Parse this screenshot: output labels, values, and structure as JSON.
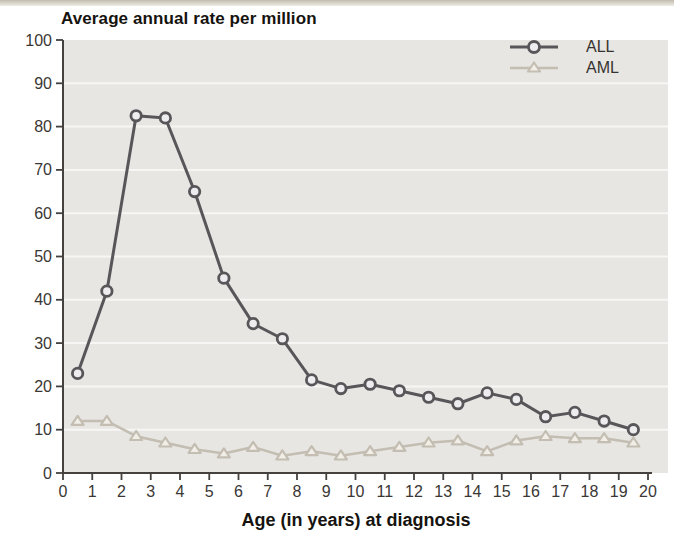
{
  "chart_data": {
    "type": "line",
    "title": "Average annual rate per million",
    "xlabel": "Age (in years) at diagnosis",
    "ylabel": "",
    "xlim": [
      0,
      20
    ],
    "ylim": [
      0,
      100
    ],
    "x_ticks": [
      0,
      1,
      2,
      3,
      4,
      5,
      6,
      7,
      8,
      9,
      10,
      11,
      12,
      13,
      14,
      15,
      16,
      17,
      18,
      19,
      20
    ],
    "y_ticks": [
      0,
      10,
      20,
      30,
      40,
      50,
      60,
      70,
      80,
      90,
      100
    ],
    "grid": "horizontal white gridlines every 10 units",
    "legend_position": "top-right inside plot",
    "x": [
      0.5,
      1.5,
      2.5,
      3.5,
      4.5,
      5.5,
      6.5,
      7.5,
      8.5,
      9.5,
      10.5,
      11.5,
      12.5,
      13.5,
      14.5,
      15.5,
      16.5,
      17.5,
      18.5,
      19.5
    ],
    "series": [
      {
        "name": "ALL",
        "marker": "circle",
        "color": "#59565a",
        "marker_fill": "#edecef",
        "values": [
          23,
          42,
          82.5,
          82,
          65,
          45,
          34.5,
          31,
          21.5,
          19.5,
          20.5,
          19,
          17.5,
          16,
          18.5,
          17,
          13,
          14,
          12,
          10
        ]
      },
      {
        "name": "AML",
        "marker": "triangle",
        "color": "#c3bdb2",
        "marker_fill": "#f1eee7",
        "values": [
          12,
          12,
          8.5,
          7,
          5.5,
          4.5,
          6,
          4,
          5,
          4,
          5,
          6,
          7,
          7.5,
          5,
          7.5,
          8.5,
          8,
          8,
          7
        ]
      }
    ],
    "colors": {
      "plot_bg": "#e7e6e3",
      "gridline": "#f7f6f4",
      "axis": "#44413e",
      "tick_text": "#3a3734",
      "title_text": "#16130f"
    }
  }
}
